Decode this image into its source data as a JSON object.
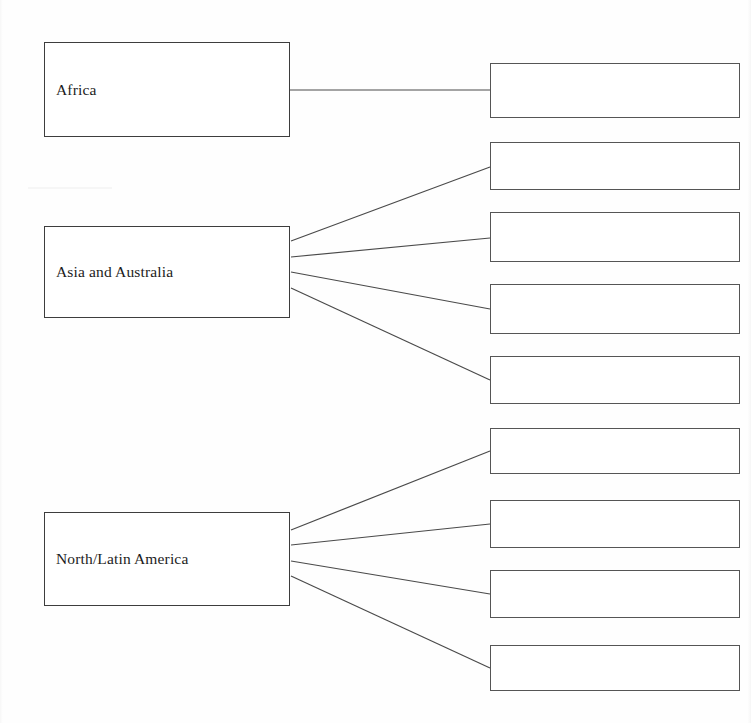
{
  "document": {
    "type": "hierarchy-diagram",
    "title": "",
    "background_color": "#fefefe",
    "line_color": "#4a4a4a",
    "text_color": "#1c1c1c",
    "width": 751,
    "height": 723
  },
  "diagram": {
    "categories": [
      {
        "id": "africa",
        "label": "Africa",
        "box": {
          "x": 44,
          "y": 42,
          "w": 246,
          "h": 95
        },
        "child_count": 1
      },
      {
        "id": "asia-australia",
        "label": "Asia and Australia",
        "box": {
          "x": 44,
          "y": 226,
          "w": 246,
          "h": 92
        },
        "child_count": 4
      },
      {
        "id": "north-latin-america",
        "label": "North/Latin America",
        "box": {
          "x": 44,
          "y": 512,
          "w": 246,
          "h": 94
        },
        "child_count": 4
      }
    ],
    "blank_boxes": [
      {
        "id": "blank-1",
        "label": "",
        "parent": "africa",
        "box": {
          "x": 490,
          "y": 63,
          "w": 250,
          "h": 55
        }
      },
      {
        "id": "blank-2",
        "label": "",
        "parent": "asia-australia",
        "box": {
          "x": 490,
          "y": 142,
          "w": 250,
          "h": 48
        }
      },
      {
        "id": "blank-3",
        "label": "",
        "parent": "asia-australia",
        "box": {
          "x": 490,
          "y": 212,
          "w": 250,
          "h": 50
        }
      },
      {
        "id": "blank-4",
        "label": "",
        "parent": "asia-australia",
        "box": {
          "x": 490,
          "y": 284,
          "w": 250,
          "h": 50
        }
      },
      {
        "id": "blank-5",
        "label": "",
        "parent": "asia-australia",
        "box": {
          "x": 490,
          "y": 356,
          "w": 250,
          "h": 48
        }
      },
      {
        "id": "blank-6",
        "label": "",
        "parent": "north-latin-america",
        "box": {
          "x": 490,
          "y": 428,
          "w": 250,
          "h": 46
        }
      },
      {
        "id": "blank-7",
        "label": "",
        "parent": "north-latin-america",
        "box": {
          "x": 490,
          "y": 500,
          "w": 250,
          "h": 48
        }
      },
      {
        "id": "blank-8",
        "label": "",
        "parent": "north-latin-america",
        "box": {
          "x": 490,
          "y": 570,
          "w": 250,
          "h": 48
        }
      },
      {
        "id": "blank-9",
        "label": "",
        "parent": "north-latin-america",
        "box": {
          "x": 490,
          "y": 645,
          "w": 250,
          "h": 46
        }
      }
    ],
    "connectors": [
      {
        "id": "conn-africa-1",
        "from": "africa",
        "to": "blank-1",
        "x1": 290,
        "y1": 90,
        "x2": 490,
        "y2": 90
      },
      {
        "id": "conn-asia-1",
        "from": "asia-australia",
        "to": "blank-2",
        "x1": 291,
        "y1": 241,
        "x2": 490,
        "y2": 167
      },
      {
        "id": "conn-asia-2",
        "from": "asia-australia",
        "to": "blank-3",
        "x1": 291,
        "y1": 257,
        "x2": 490,
        "y2": 238
      },
      {
        "id": "conn-asia-3",
        "from": "asia-australia",
        "to": "blank-4",
        "x1": 291,
        "y1": 272,
        "x2": 490,
        "y2": 309
      },
      {
        "id": "conn-asia-4",
        "from": "asia-australia",
        "to": "blank-5",
        "x1": 291,
        "y1": 288,
        "x2": 490,
        "y2": 380
      },
      {
        "id": "conn-nla-1",
        "from": "north-latin-america",
        "to": "blank-6",
        "x1": 291,
        "y1": 530,
        "x2": 490,
        "y2": 451
      },
      {
        "id": "conn-nla-2",
        "from": "north-latin-america",
        "to": "blank-7",
        "x1": 291,
        "y1": 545,
        "x2": 490,
        "y2": 524
      },
      {
        "id": "conn-nla-3",
        "from": "north-latin-america",
        "to": "blank-8",
        "x1": 291,
        "y1": 561,
        "x2": 490,
        "y2": 594
      },
      {
        "id": "conn-nla-4",
        "from": "north-latin-america",
        "to": "blank-9",
        "x1": 291,
        "y1": 576,
        "x2": 490,
        "y2": 668
      }
    ]
  }
}
